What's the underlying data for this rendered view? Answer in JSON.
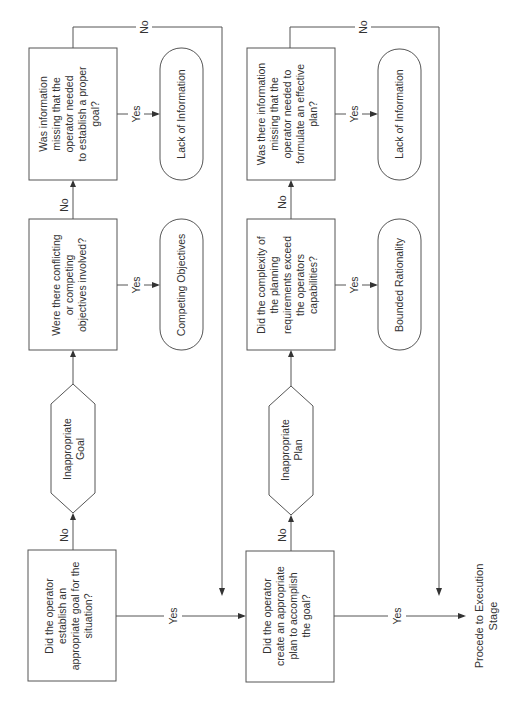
{
  "diagram": {
    "orientation": "rotated-90-ccw",
    "colors": {
      "stroke": "#555555",
      "text": "#333333",
      "background": "#ffffff"
    },
    "goal_stage": {
      "q_establish_goal": [
        "Did the operator",
        "establish an",
        "appropriate goal for the",
        "situation?"
      ],
      "inappropriate_goal": [
        "Inappropriate",
        "Goal"
      ],
      "q_conflicting": [
        "Were there conflicting",
        "or competing",
        "objectives involved?"
      ],
      "q_info_goal": [
        "Was information",
        "missing that the",
        "operator needed",
        "to establish a proper",
        "goal?"
      ],
      "t_competing": "Competing Objectives",
      "t_lack_info": "Lack of Information"
    },
    "plan_stage": {
      "q_create_plan": [
        "Did the operator",
        "create an appropriate",
        "plan to accomplish",
        "the goal?"
      ],
      "inappropriate_plan": [
        "Inappropriate",
        "Plan"
      ],
      "q_complexity": [
        "Did the complexity of",
        "the planning",
        "requirements exceed",
        "the operators",
        "capabilities?"
      ],
      "q_info_plan": [
        "Was there information",
        "missing that the",
        "operator needed to",
        "formulate an effective",
        "plan?"
      ],
      "t_bounded": "Bounded Rationality",
      "t_lack_info": "Lack of Information"
    },
    "exit": [
      "Procede to Execution",
      "Stage"
    ],
    "edge_labels": {
      "yes": "Yes",
      "no": "No"
    }
  }
}
